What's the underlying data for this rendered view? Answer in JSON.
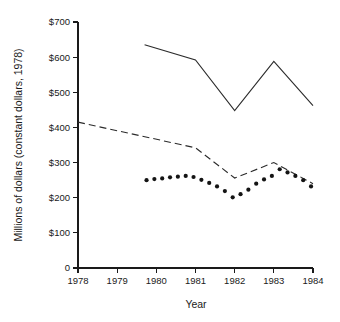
{
  "chart_data": {
    "type": "line",
    "title": "",
    "xlabel": "Year",
    "ylabel": "Millions of dollars (constant dollars, 1978)",
    "xlim": [
      1978,
      1984
    ],
    "ylim": [
      0,
      700
    ],
    "grid": false,
    "legend": "none",
    "x_tick_labels": [
      "1978",
      "1979",
      "1980",
      "1981",
      "1982",
      "1983",
      "1984"
    ],
    "x_tick_values": [
      1978,
      1979,
      1980,
      1981,
      1982,
      1983,
      1984
    ],
    "y_tick_labels": [
      "0",
      "$100",
      "$200",
      "$300",
      "$400",
      "$500",
      "$600",
      "$700"
    ],
    "y_tick_values": [
      0,
      100,
      200,
      300,
      400,
      500,
      600,
      700
    ],
    "series": [
      {
        "name": "solid-line-series",
        "style": "solid",
        "x": [
          1979.7,
          1981.0,
          1982.0,
          1983.0,
          1984.0
        ],
        "values": [
          635,
          592,
          448,
          588,
          462
        ]
      },
      {
        "name": "dashed-line-series",
        "style": "dashed",
        "x": [
          1978.0,
          1981.0,
          1982.0,
          1983.0,
          1984.0
        ],
        "values": [
          415,
          342,
          256,
          300,
          240
        ]
      },
      {
        "name": "dotted-marker-series",
        "style": "dotted",
        "x": [
          1979.75,
          1979.95,
          1980.15,
          1980.35,
          1980.55,
          1980.75,
          1980.95,
          1981.15,
          1981.35,
          1981.55,
          1981.75,
          1981.95,
          1982.15,
          1982.35,
          1982.55,
          1982.75,
          1982.95,
          1983.15,
          1983.35,
          1983.55,
          1983.75,
          1983.95
        ],
        "values": [
          250,
          253,
          255,
          258,
          260,
          262,
          259,
          251,
          242,
          232,
          219,
          201,
          210,
          223,
          240,
          252,
          262,
          281,
          272,
          262,
          250,
          232
        ]
      }
    ]
  },
  "axis": {
    "x_title": "Year",
    "y_title": "Millions of dollars (constant dollars, 1978)"
  }
}
